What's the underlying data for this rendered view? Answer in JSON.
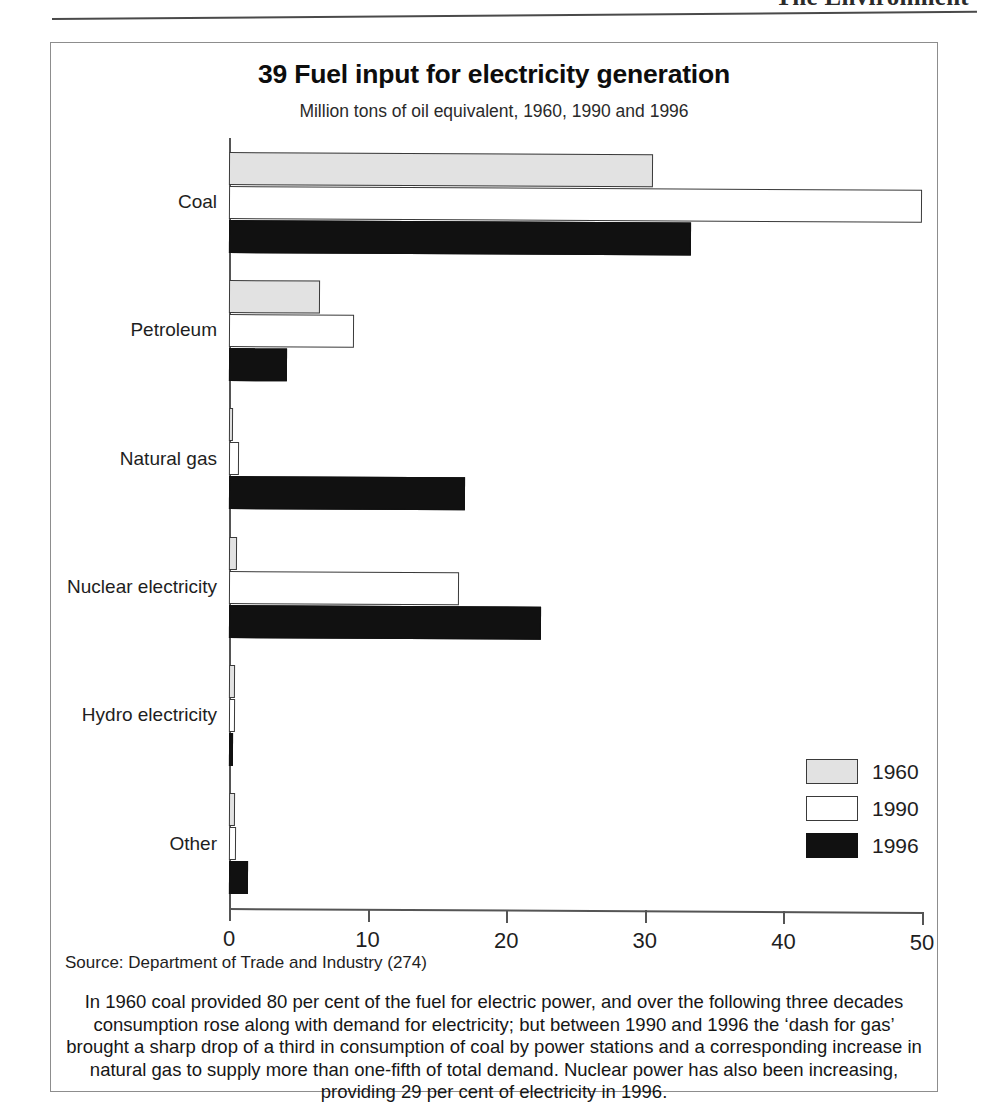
{
  "page": {
    "running_head": "The Environment"
  },
  "figure": {
    "title": "39 Fuel input for electricity generation",
    "subtitle": "Million tons of oil equivalent, 1960, 1990 and 1996",
    "source": "Source: Department of Trade and Industry (274)",
    "caption": "In 1960 coal provided 80 per cent of the fuel for electric power, and over the following three decades consumption rose along with demand for electricity; but between 1990 and 1996 the ‘dash for gas’ brought a sharp drop of a third in consumption of coal by power stations and a corresponding increase in natural gas to supply more than one-fifth of total demand. Nuclear power has also been increasing, providing 29 per cent of electricity in 1996."
  },
  "legend": {
    "position": "bottom-right",
    "entries": [
      {
        "label": "1960",
        "color": "#e2e2e2"
      },
      {
        "label": "1990",
        "color": "#ffffff"
      },
      {
        "label": "1996",
        "color": "#111111"
      }
    ]
  },
  "chart_data": {
    "type": "bar",
    "orientation": "horizontal",
    "title": "39 Fuel input for electricity generation",
    "subtitle": "Million tons of oil equivalent, 1960, 1990 and 1996",
    "xlabel": "",
    "ylabel": "",
    "xlim": [
      0,
      50
    ],
    "xticks": [
      0,
      10,
      20,
      30,
      40,
      50
    ],
    "xticklabels": [
      "0",
      "10",
      "20",
      "30",
      "40",
      "50"
    ],
    "grid": false,
    "legend_position": "bottom-right",
    "categories": [
      "Coal",
      "Petroleum",
      "Natural gas",
      "Nuclear electricity",
      "Hydro electricity",
      "Other"
    ],
    "series": [
      {
        "name": "1960",
        "color": "#e2e2e2",
        "values": [
          30.6,
          6.6,
          0.1,
          0.6,
          0.4,
          0.4
        ]
      },
      {
        "name": "1990",
        "color": "#ffffff",
        "values": [
          50.0,
          9.0,
          0.7,
          16.6,
          0.4,
          0.5
        ]
      },
      {
        "name": "1996",
        "color": "#111111",
        "values": [
          33.3,
          4.2,
          17.0,
          22.5,
          0.3,
          1.4
        ]
      }
    ],
    "units": "Million tons of oil equivalent",
    "source": "Department of Trade and Industry (274)"
  }
}
